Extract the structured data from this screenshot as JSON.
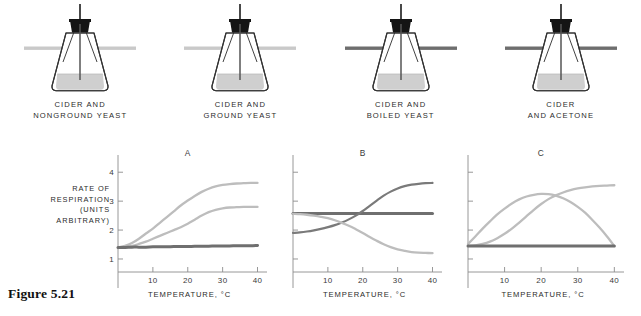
{
  "figure": {
    "caption": "Figure 5.21",
    "y_axis_label_lines": [
      "RATE OF",
      "RESPIRATION",
      "(UNITS",
      "ARBITRARY)"
    ],
    "x_axis_title": "TEMPERATURE, °C"
  },
  "colors": {
    "light_curve": "#bdbdbd",
    "dark_curve": "#7a7a7a",
    "flat_dark_line": "#6f6f6f",
    "flask_outline": "#333333",
    "flask_liquid": "#cfcfcf",
    "stopper": "#141414",
    "bar_light": "#c9c9c9",
    "bar_dark": "#6e6e6e",
    "axis": "#8c8c8c",
    "text": "#2b2b2b"
  },
  "apparatus": [
    {
      "id": "nonground-yeast",
      "caption_lines": [
        "CIDER AND",
        "NONGROUND YEAST"
      ],
      "bar_color_name": "bar_light",
      "bar_color": "#c9c9c9",
      "bar_width": 112
    },
    {
      "id": "ground-yeast",
      "caption_lines": [
        "CIDER AND",
        "GROUND YEAST"
      ],
      "bar_color_name": "bar_light",
      "bar_color": "#c9c9c9",
      "bar_width": 112
    },
    {
      "id": "boiled-yeast",
      "caption_lines": [
        "CIDER AND",
        "BOILED YEAST"
      ],
      "bar_color_name": "bar_dark",
      "bar_color": "#6e6e6e",
      "bar_width": 112
    },
    {
      "id": "cider-acetone",
      "caption_lines": [
        "CIDER",
        "AND ACETONE"
      ],
      "bar_color_name": "bar_dark",
      "bar_color": "#6e6e6e",
      "bar_width": 112
    }
  ],
  "chart_data": [
    {
      "id": "A",
      "type": "line",
      "title": "A",
      "xlabel": "TEMPERATURE, °C",
      "ylabel": "RATE OF RESPIRATION (UNITS ARBITRARY)",
      "xlim": [
        0,
        41
      ],
      "ylim": [
        0.55,
        4.25
      ],
      "xticks": [
        10,
        20,
        30,
        40
      ],
      "yticks": [
        1,
        2,
        3,
        4
      ],
      "grid": false,
      "legend": "none",
      "x": [
        0,
        2,
        4,
        6,
        8,
        10,
        12,
        14,
        16,
        18,
        20,
        22,
        24,
        26,
        28,
        30,
        32,
        34,
        36,
        38,
        40
      ],
      "series": [
        {
          "name": "upper-rising-light",
          "color": "#bdbdbd",
          "style": "light",
          "values": [
            1.4,
            1.45,
            1.55,
            1.7,
            1.88,
            2.05,
            2.25,
            2.45,
            2.65,
            2.85,
            3.02,
            3.18,
            3.32,
            3.43,
            3.51,
            3.56,
            3.59,
            3.61,
            3.62,
            3.63,
            3.63
          ]
        },
        {
          "name": "lower-rising-light",
          "color": "#bdbdbd",
          "style": "light",
          "values": [
            1.38,
            1.4,
            1.45,
            1.52,
            1.6,
            1.7,
            1.8,
            1.9,
            2.0,
            2.1,
            2.22,
            2.36,
            2.5,
            2.62,
            2.7,
            2.75,
            2.78,
            2.79,
            2.8,
            2.8,
            2.8
          ]
        },
        {
          "name": "flat-dark",
          "color": "#6f6f6f",
          "style": "flat-thick",
          "values": [
            1.4,
            1.4,
            1.41,
            1.41,
            1.41,
            1.42,
            1.42,
            1.42,
            1.43,
            1.43,
            1.43,
            1.44,
            1.44,
            1.44,
            1.45,
            1.45,
            1.45,
            1.46,
            1.46,
            1.46,
            1.47
          ]
        }
      ]
    },
    {
      "id": "B",
      "type": "line",
      "title": "B",
      "xlabel": "TEMPERATURE, °C",
      "ylabel": "",
      "xlim": [
        0,
        41
      ],
      "ylim": [
        0.55,
        4.25
      ],
      "xticks": [
        10,
        20,
        30,
        40
      ],
      "yticks": [
        1,
        2,
        3,
        4
      ],
      "grid": false,
      "legend": "none",
      "x": [
        0,
        2,
        4,
        6,
        8,
        10,
        12,
        14,
        16,
        18,
        20,
        22,
        24,
        26,
        28,
        30,
        32,
        34,
        36,
        38,
        40
      ],
      "series": [
        {
          "name": "flat-dark",
          "color": "#6f6f6f",
          "style": "flat-thick",
          "values": [
            2.57,
            2.57,
            2.57,
            2.57,
            2.57,
            2.57,
            2.57,
            2.57,
            2.57,
            2.57,
            2.57,
            2.57,
            2.57,
            2.57,
            2.57,
            2.57,
            2.57,
            2.57,
            2.57,
            2.57,
            2.57
          ]
        },
        {
          "name": "rising-dark-sigmoid",
          "color": "#7a7a7a",
          "style": "dark",
          "values": [
            1.9,
            1.92,
            1.95,
            1.99,
            2.04,
            2.1,
            2.17,
            2.26,
            2.37,
            2.5,
            2.66,
            2.84,
            3.02,
            3.19,
            3.33,
            3.44,
            3.52,
            3.57,
            3.6,
            3.62,
            3.63
          ]
        },
        {
          "name": "falling-light-sigmoid",
          "color": "#bdbdbd",
          "style": "light",
          "values": [
            2.56,
            2.55,
            2.53,
            2.5,
            2.46,
            2.41,
            2.34,
            2.25,
            2.15,
            2.03,
            1.9,
            1.76,
            1.63,
            1.51,
            1.41,
            1.33,
            1.28,
            1.24,
            1.22,
            1.21,
            1.2
          ]
        }
      ]
    },
    {
      "id": "C",
      "type": "line",
      "title": "C",
      "xlabel": "TEMPERATURE, °C",
      "ylabel": "",
      "xlim": [
        0,
        41
      ],
      "ylim": [
        0.55,
        4.25
      ],
      "xticks": [
        10,
        20,
        30,
        40
      ],
      "yticks": [
        1,
        2,
        3,
        4
      ],
      "grid": false,
      "legend": "none",
      "x": [
        0,
        2,
        4,
        6,
        8,
        10,
        12,
        14,
        16,
        18,
        20,
        22,
        24,
        26,
        28,
        30,
        32,
        34,
        36,
        38,
        40
      ],
      "series": [
        {
          "name": "peaked-light",
          "color": "#bdbdbd",
          "style": "light",
          "values": [
            1.52,
            1.78,
            2.05,
            2.3,
            2.54,
            2.74,
            2.92,
            3.06,
            3.16,
            3.22,
            3.25,
            3.24,
            3.19,
            3.1,
            2.97,
            2.8,
            2.6,
            2.35,
            2.08,
            1.78,
            1.45
          ]
        },
        {
          "name": "rising-light-sigmoid",
          "color": "#bdbdbd",
          "style": "light",
          "values": [
            1.45,
            1.47,
            1.52,
            1.6,
            1.72,
            1.87,
            2.05,
            2.26,
            2.48,
            2.7,
            2.9,
            3.07,
            3.2,
            3.3,
            3.38,
            3.44,
            3.48,
            3.51,
            3.53,
            3.54,
            3.55
          ]
        },
        {
          "name": "flat-dark",
          "color": "#6f6f6f",
          "style": "flat-thick",
          "values": [
            1.45,
            1.45,
            1.45,
            1.45,
            1.45,
            1.45,
            1.45,
            1.45,
            1.45,
            1.45,
            1.45,
            1.45,
            1.45,
            1.45,
            1.45,
            1.45,
            1.45,
            1.45,
            1.45,
            1.45,
            1.45
          ]
        }
      ]
    }
  ]
}
